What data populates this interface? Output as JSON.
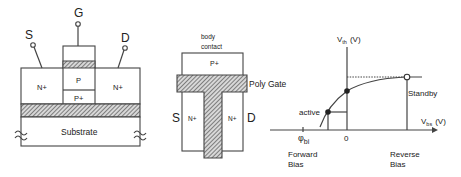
{
  "figure": {
    "left_diagram": {
      "title": "SOI MOSFET cross-section",
      "terminals": {
        "source": "S",
        "gate": "G",
        "drain": "D"
      },
      "regions": {
        "source_region": "N+",
        "drain_region": "N+",
        "channel": "P",
        "body": "P+",
        "substrate": "Substrate"
      }
    },
    "middle_diagram": {
      "title": "Top view",
      "body_contact_line1": "body",
      "body_contact_line2": "contact",
      "body_region": "P+",
      "gate_label": "Poly Gate",
      "source_label": "S",
      "drain_label": "D",
      "source_region": "N+",
      "drain_region": "N+"
    },
    "right_graph": {
      "y_axis_label_main": "V",
      "y_axis_label_sub": "th",
      "y_axis_unit": "(V)",
      "x_axis_label_main": "V",
      "x_axis_label_sub": "bs",
      "x_axis_unit": "(V)",
      "origin_label": "0",
      "phi_label_main": "φ",
      "phi_label_sub": "bi",
      "active_label": "active",
      "standby_label": "Standby",
      "forward_line1": "Forward",
      "forward_line2": "Bias",
      "reverse_line1": "Reverse",
      "reverse_line2": "Bias"
    }
  },
  "colors": {
    "line": "#444444",
    "hatch": "#555555",
    "text": "#222222"
  }
}
